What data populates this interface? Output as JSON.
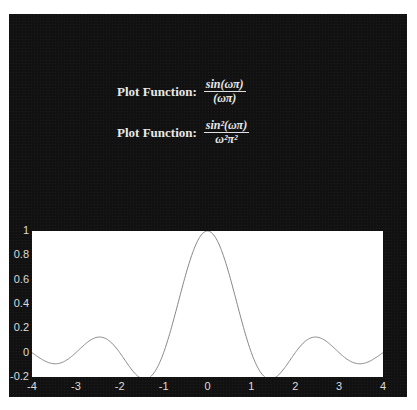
{
  "formulas": [
    {
      "label": "Plot Function:",
      "numerator": "sin(ωπ)",
      "denominator": "(ωπ)"
    },
    {
      "label": "Plot Function:",
      "numerator": "sin²(ωπ)",
      "denominator": "ω²π²"
    }
  ],
  "colors": {
    "background": "#111111",
    "plot_bg": "#ffffff",
    "line": "#888888",
    "text": "#e8e8e8"
  },
  "chart_data": {
    "type": "line",
    "title": "",
    "xlabel": "",
    "ylabel": "",
    "xlim": [
      -4,
      4
    ],
    "ylim": [
      -0.2,
      1
    ],
    "xticks": [
      "-4",
      "-3",
      "-2",
      "-1",
      "0",
      "1",
      "2",
      "3",
      "4"
    ],
    "yticks": [
      "1",
      "0.8",
      "0.6",
      "0.4",
      "0.2",
      "0",
      "-0.2"
    ],
    "grid": false,
    "series": [
      {
        "name": "sin(ωπ)/(ωπ)",
        "x": [
          -4,
          -3.5,
          -3,
          -2.5,
          -2,
          -1.5,
          -1,
          -0.5,
          0,
          0.5,
          1,
          1.5,
          2,
          2.5,
          3,
          3.5,
          4
        ],
        "y": [
          0,
          -0.091,
          0,
          0.127,
          0,
          -0.212,
          0,
          0.637,
          1,
          0.637,
          0,
          -0.212,
          0,
          0.127,
          0,
          -0.091,
          0
        ]
      }
    ]
  }
}
